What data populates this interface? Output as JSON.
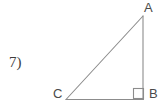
{
  "figure": {
    "problem_number": "7)",
    "shape": "right-triangle",
    "stroke_color": "#8c8c8c",
    "label_color": "#4a4a4a",
    "background_color": "#ffffff",
    "vertices": [
      {
        "name": "A",
        "label": "A",
        "x": 143,
        "y": 16,
        "label_x": 144,
        "label_y": 1
      },
      {
        "name": "B",
        "label": "B",
        "x": 143,
        "y": 99,
        "label_x": 149,
        "label_y": 87
      },
      {
        "name": "C",
        "label": "C",
        "x": 66,
        "y": 99,
        "label_x": 53,
        "label_y": 87
      }
    ],
    "sides": [
      {
        "name": "hypotenuse-CA",
        "from": "C",
        "to": "A"
      },
      {
        "name": "leg-AB",
        "from": "A",
        "to": "B"
      },
      {
        "name": "leg-CB",
        "from": "C",
        "to": "B"
      }
    ],
    "right_angle": {
      "at_vertex": "B",
      "marker": "square",
      "x": 134,
      "y": 89,
      "size": 10
    }
  }
}
